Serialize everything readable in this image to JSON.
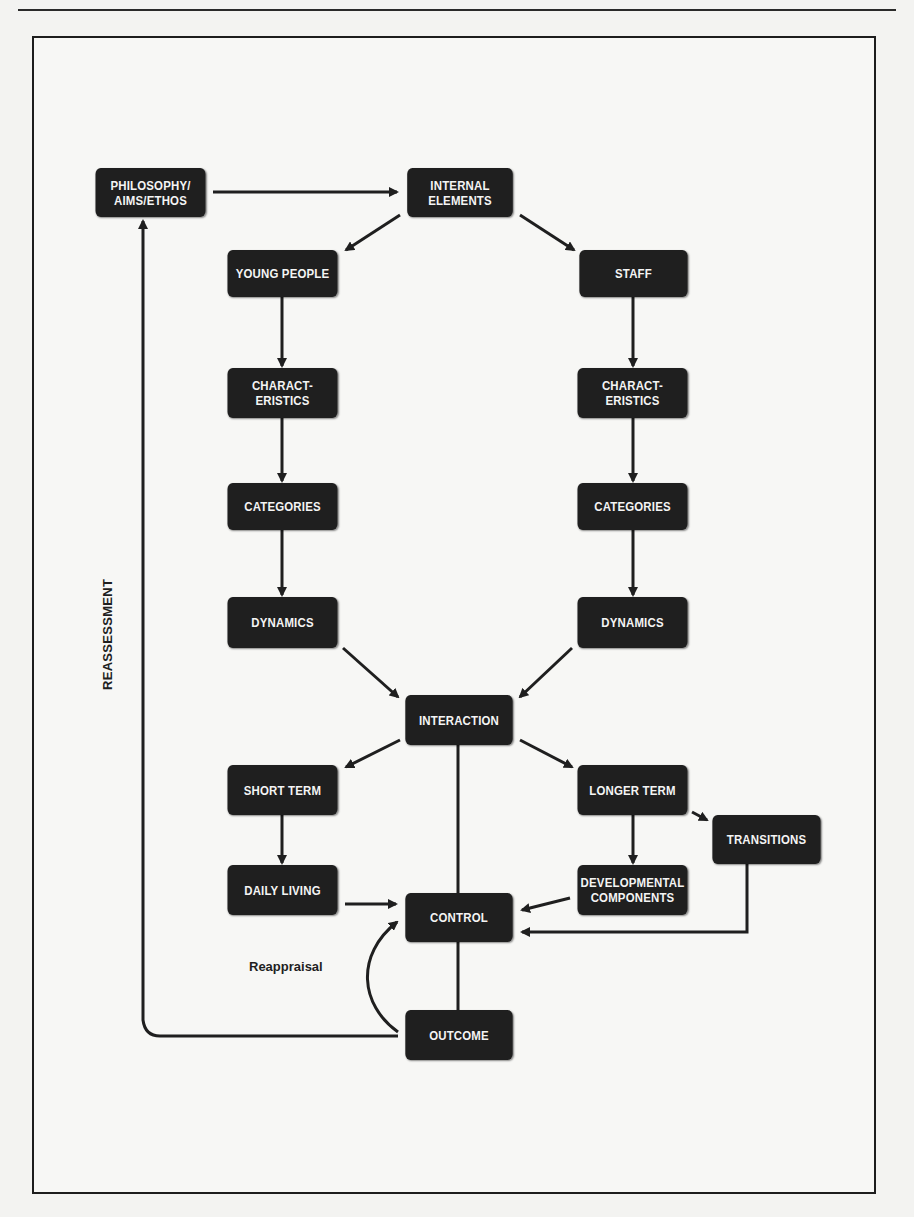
{
  "diagram": {
    "nodes": {
      "philosophy": "PHILOSOPHY/\nAIMS/ETHOS",
      "internal_elements": "INTERNAL\nELEMENTS",
      "young_people": "YOUNG PEOPLE",
      "staff": "STAFF",
      "characteristics_left": "CHARACT-\nERISTICS",
      "characteristics_right": "CHARACT-\nERISTICS",
      "categories_left": "CATEGORIES",
      "categories_right": "CATEGORIES",
      "dynamics_left": "DYNAMICS",
      "dynamics_right": "DYNAMICS",
      "interaction": "INTERACTION",
      "short_term": "SHORT TERM",
      "longer_term": "LONGER TERM",
      "transitions": "TRANSITIONS",
      "daily_living": "DAILY LIVING",
      "developmental_components": "DEVELOPMENTAL\nCOMPONENTS",
      "control": "CONTROL",
      "outcome": "OUTCOME"
    },
    "edge_labels": {
      "reassessment": "REASSESSMENT",
      "reappraisal": "Reappraisal"
    },
    "edges": [
      {
        "from": "philosophy",
        "to": "internal_elements"
      },
      {
        "from": "internal_elements",
        "to": "young_people"
      },
      {
        "from": "internal_elements",
        "to": "staff"
      },
      {
        "from": "young_people",
        "to": "characteristics_left"
      },
      {
        "from": "characteristics_left",
        "to": "categories_left"
      },
      {
        "from": "categories_left",
        "to": "dynamics_left"
      },
      {
        "from": "staff",
        "to": "characteristics_right"
      },
      {
        "from": "characteristics_right",
        "to": "categories_right"
      },
      {
        "from": "categories_right",
        "to": "dynamics_right"
      },
      {
        "from": "dynamics_left",
        "to": "interaction"
      },
      {
        "from": "dynamics_right",
        "to": "interaction"
      },
      {
        "from": "interaction",
        "to": "short_term"
      },
      {
        "from": "interaction",
        "to": "longer_term"
      },
      {
        "from": "interaction",
        "to": "control",
        "arrow": false
      },
      {
        "from": "short_term",
        "to": "daily_living"
      },
      {
        "from": "longer_term",
        "to": "developmental_components"
      },
      {
        "from": "longer_term",
        "to": "transitions"
      },
      {
        "from": "daily_living",
        "to": "control"
      },
      {
        "from": "developmental_components",
        "to": "control"
      },
      {
        "from": "transitions",
        "to": "control"
      },
      {
        "from": "control",
        "to": "outcome",
        "arrow": false
      },
      {
        "from": "outcome",
        "to": "control",
        "label": "Reappraisal"
      },
      {
        "from": "outcome",
        "to": "philosophy",
        "label": "REASSESSMENT"
      }
    ]
  },
  "colors": {
    "node_fill": "#1f1f1f",
    "node_text": "#f4f4f4",
    "line": "#1f1f1f",
    "page": "#f3f3f1"
  }
}
